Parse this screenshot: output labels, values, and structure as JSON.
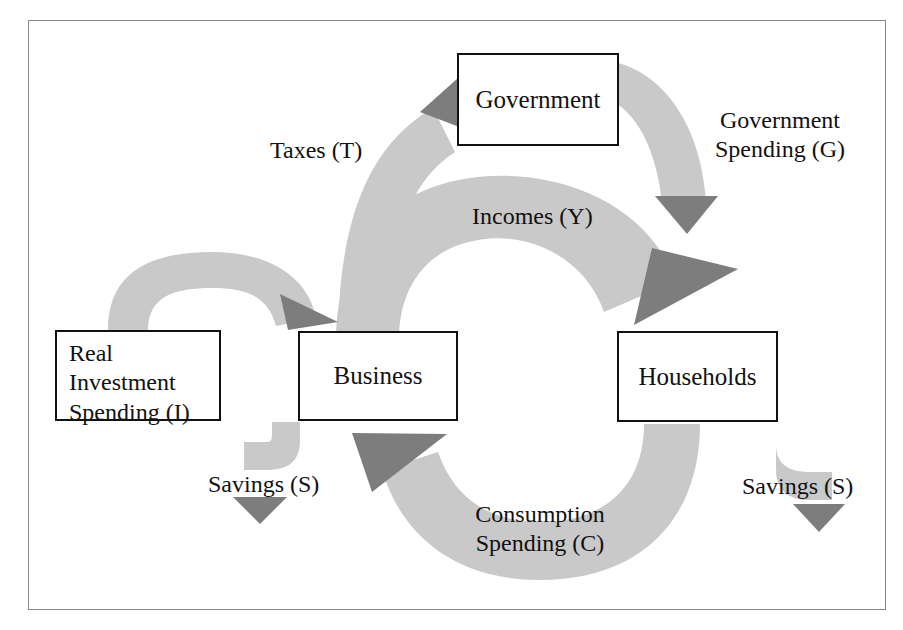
{
  "diagram": {
    "colors": {
      "band": "#c9c9c9",
      "arrowhead": "#7d7d7d",
      "box_border": "#111111",
      "frame_border": "#888888",
      "background": "#ffffff",
      "text": "#111111"
    },
    "nodes": [
      {
        "id": "government",
        "label": "Government"
      },
      {
        "id": "business",
        "label": "Business"
      },
      {
        "id": "households",
        "label": "Households"
      },
      {
        "id": "real-investment",
        "label": "Real\nInvestment\nSpending (I)"
      }
    ],
    "flows": [
      {
        "id": "taxes",
        "label": "Taxes (T)",
        "from": "business",
        "to": "government"
      },
      {
        "id": "government-spending",
        "label": "Government\nSpending (G)",
        "from": "government",
        "to": "households"
      },
      {
        "id": "incomes",
        "label": "Incomes (Y)",
        "from": "business",
        "to": "households"
      },
      {
        "id": "consumption",
        "label": "Consumption\nSpending (C)",
        "from": "households",
        "to": "business"
      },
      {
        "id": "real-investment-flow",
        "label": "",
        "from": "real-investment",
        "to": "business"
      },
      {
        "id": "savings-business",
        "label": "Savings (S)",
        "from": "business",
        "to": ""
      },
      {
        "id": "savings-households",
        "label": "Savings (S)",
        "from": "households",
        "to": ""
      }
    ]
  }
}
